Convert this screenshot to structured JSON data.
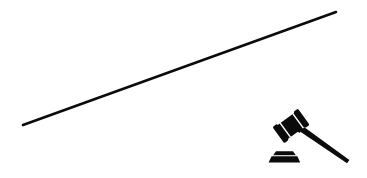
{
  "canvas": {
    "width": 367,
    "height": 178,
    "background_color": "#ffffff",
    "ink_color": "#0b0b0b",
    "description": "Minimal black line art on a white background: a long thin diagonal rule rising from lower-left to upper-right, with a judge's gavel resting beside its sounding block in the lower-right corner."
  },
  "diagram_data": {
    "type": "line-art",
    "title": "Gavel with diagonal rule",
    "elements": [
      {
        "id": "diagonal-rule",
        "name": "diagonal-line",
        "shape": "line",
        "start_x": 23,
        "start_y": 125,
        "end_x": 336,
        "end_y": 12,
        "stroke_width": 2.6,
        "color": "#0b0b0b",
        "slope": -0.361,
        "length": 333
      },
      {
        "id": "gavel-head",
        "name": "gavel-head",
        "shape": "tilted-barrel",
        "center_x": 291,
        "center_y": 126,
        "width": 26,
        "height": 17,
        "rotation_deg": -36,
        "color": "#0b0b0b",
        "bands": 2
      },
      {
        "id": "gavel-handle",
        "name": "gavel-handle",
        "shape": "tapered-rod",
        "start_x": 296,
        "start_y": 131,
        "end_x": 348,
        "end_y": 161,
        "stroke_width": 4.2,
        "color": "#0b0b0b"
      },
      {
        "id": "sounding-block",
        "name": "sounding-block",
        "shape": "stepped-trapezoid",
        "left_x": 268,
        "right_x": 300,
        "top_y": 151,
        "bottom_y": 162,
        "color": "#0b0b0b",
        "tiers": 2
      }
    ]
  }
}
